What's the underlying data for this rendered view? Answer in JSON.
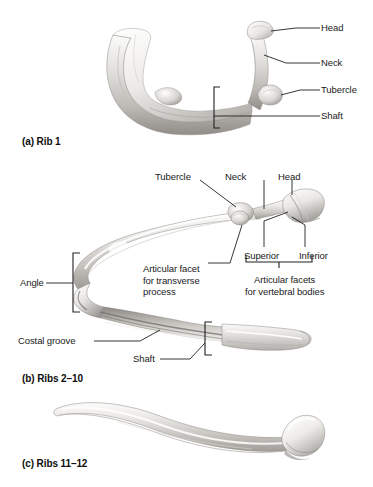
{
  "figure": {
    "title_visible": false,
    "background_color": "#ffffff",
    "line_color": "#202020",
    "text_color": "#1a1a1a",
    "bone_light": "#f2f1ef",
    "bone_mid": "#c9c7c4",
    "bone_dark": "#8d8b88",
    "bone_shadow": "#6e6c6a"
  },
  "panels": [
    {
      "id": "panel-a",
      "caption": "(a) Rib 1",
      "labels": [
        {
          "name": "head",
          "text": "Head"
        },
        {
          "name": "neck",
          "text": "Neck"
        },
        {
          "name": "tubercle",
          "text": "Tubercle"
        },
        {
          "name": "shaft",
          "text": "Shaft"
        }
      ]
    },
    {
      "id": "panel-b",
      "caption": "(b) Ribs 2–10",
      "labels": [
        {
          "name": "tubercle",
          "text": "Tubercle"
        },
        {
          "name": "neck",
          "text": "Neck"
        },
        {
          "name": "head",
          "text": "Head"
        },
        {
          "name": "superior",
          "text": "Superior"
        },
        {
          "name": "inferior",
          "text": "Inferior"
        },
        {
          "name": "articular-facet-transverse",
          "text": "Articular facet\nfor transverse\nprocess"
        },
        {
          "name": "articular-facets-vertebral",
          "text": "Articular facets\nfor vertebral bodies"
        },
        {
          "name": "angle",
          "text": "Angle"
        },
        {
          "name": "costal-groove",
          "text": "Costal groove"
        },
        {
          "name": "shaft",
          "text": "Shaft"
        }
      ]
    },
    {
      "id": "panel-c",
      "caption": "(c) Ribs 11–12",
      "labels": []
    }
  ]
}
